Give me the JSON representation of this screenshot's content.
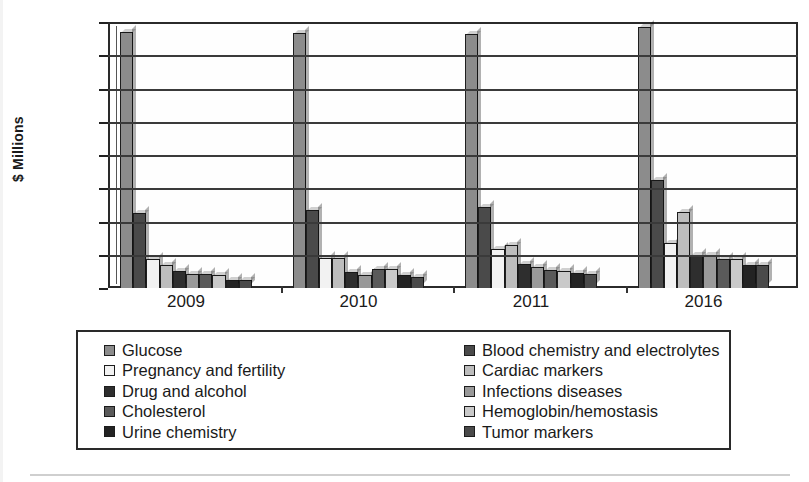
{
  "chart_data": {
    "type": "bar",
    "title": "",
    "subtitle": "",
    "xlabel": "",
    "ylabel": "$ Millions",
    "categories": [
      "2009",
      "2010",
      "2011",
      "2016"
    ],
    "ylim": [
      0,
      8000
    ],
    "ytick_step": 1000,
    "ytick_labels": [
      "0",
      "1,000",
      "2,000",
      "3,000",
      "4,000",
      "5,000",
      "6,000",
      "7,000",
      "8,000"
    ],
    "grid": true,
    "legend_position": "bottom",
    "legend_columns": 2,
    "series": [
      {
        "name": "Glucose",
        "color": "#8c8c8c",
        "values": [
          7700,
          7680,
          7640,
          7850
        ]
      },
      {
        "name": "Blood chemistry and electrolytes",
        "color": "#4a4a4a",
        "values": [
          2250,
          2350,
          2450,
          3250
        ]
      },
      {
        "name": "Pregnancy and fertility",
        "color": "#f2f2f2",
        "values": [
          880,
          900,
          1180,
          1350
        ]
      },
      {
        "name": "Cardiac markers",
        "color": "#bdbdbd",
        "values": [
          700,
          900,
          1280,
          2300
        ]
      },
      {
        "name": "Drug and alcohol",
        "color": "#2e2e2e",
        "values": [
          520,
          480,
          720,
          1000
        ]
      },
      {
        "name": "Infections diseases",
        "color": "#999999",
        "values": [
          430,
          390,
          620,
          1000
        ]
      },
      {
        "name": "Cholesterol",
        "color": "#5a5a5a",
        "values": [
          430,
          560,
          540,
          880
        ]
      },
      {
        "name": "Hemoglobin/hemostasis",
        "color": "#c9c9c9",
        "values": [
          400,
          560,
          520,
          880
        ]
      },
      {
        "name": "Urine chemistry",
        "color": "#232323",
        "values": [
          250,
          380,
          440,
          700
        ]
      },
      {
        "name": "Tumor markers",
        "color": "#4a4a4a",
        "values": [
          230,
          330,
          420,
          700
        ]
      }
    ]
  },
  "legend": {
    "left_column": [
      "Glucose",
      "Pregnancy and fertility",
      "Drug and alcohol",
      "Cholesterol",
      "Urine chemistry"
    ],
    "right_column": [
      "Blood chemistry and electrolytes",
      "Cardiac markers",
      "Infections diseases",
      "Hemoglobin/hemostasis",
      "Tumor markers"
    ]
  }
}
